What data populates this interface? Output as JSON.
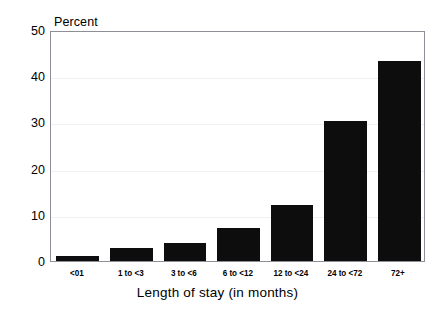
{
  "chart_data": {
    "type": "bar",
    "title": "",
    "xlabel": "Length of stay (in months)",
    "ylabel": "Percent",
    "categories": [
      "<01",
      "1 to <3",
      "3 to <6",
      "6 to <12",
      "12 to <24",
      "24 to <72",
      "72+"
    ],
    "values": [
      1.0,
      2.8,
      3.9,
      7.1,
      12.1,
      30.3,
      43.3
    ],
    "ylim": [
      0,
      50
    ],
    "yticks": [
      0,
      10,
      20,
      30,
      40,
      50
    ],
    "ytick_labels": [
      "0",
      "10",
      "20",
      "30",
      "40",
      "50"
    ],
    "grid": true,
    "grid_axis": "y",
    "legend": false,
    "bar_color": "#0d0d0d",
    "axis_color": "#8e8e96",
    "grid_color": "#f0f0f2"
  },
  "axes": {
    "y_axis_title": "Percent",
    "x_axis_title": "Length of stay (in months)"
  },
  "ticks": {
    "y": [
      "50",
      "40",
      "30",
      "20",
      "10",
      "0"
    ],
    "x": [
      "<01",
      "1 to <3",
      "3 to <6",
      "6 to <12",
      "12 to <24",
      "24 to <72",
      "72+"
    ]
  },
  "figure": {
    "title_remnant": ""
  }
}
